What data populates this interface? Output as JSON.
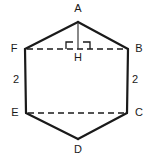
{
  "figure": {
    "kind": "hexagon-geometry-diagram",
    "background_color": "#ffffff",
    "stroke_color": "#1a1a1a",
    "label_color": "#1a1a1a",
    "canvas": {
      "width": 151,
      "height": 161
    }
  },
  "vertices": [
    {
      "id": "A",
      "label": "A",
      "x": 78,
      "y": 22,
      "label_x": 78,
      "label_y": 8
    },
    {
      "id": "B",
      "label": "B",
      "x": 128,
      "y": 49,
      "label_x": 139,
      "label_y": 44
    },
    {
      "id": "C",
      "label": "C",
      "x": 127,
      "y": 113,
      "label_x": 139,
      "label_y": 109
    },
    {
      "id": "D",
      "label": "D",
      "x": 78,
      "y": 139,
      "label_x": 78,
      "label_y": 149
    },
    {
      "id": "E",
      "label": "E",
      "x": 26,
      "y": 113,
      "label_x": 15,
      "label_y": 109
    },
    {
      "id": "F",
      "label": "F",
      "x": 25,
      "y": 49,
      "label_x": 14,
      "label_y": 44
    },
    {
      "id": "H",
      "label": "H",
      "x": 78,
      "y": 49,
      "label_x": 78,
      "label_y": 54
    }
  ],
  "solid_edges": [
    {
      "name": "edge-A-B",
      "from": "A",
      "to": "B"
    },
    {
      "name": "edge-B-C",
      "from": "B",
      "to": "C"
    },
    {
      "name": "edge-C-D",
      "from": "C",
      "to": "D"
    },
    {
      "name": "edge-D-E",
      "from": "D",
      "to": "E"
    },
    {
      "name": "edge-E-F",
      "from": "E",
      "to": "F"
    },
    {
      "name": "edge-F-A",
      "from": "F",
      "to": "A"
    }
  ],
  "dashed_segments": [
    {
      "name": "segment-F-B",
      "from": "F",
      "to": "B"
    },
    {
      "name": "segment-E-C",
      "from": "E",
      "to": "C"
    },
    {
      "name": "segment-A-H",
      "from": "A",
      "to": "H"
    }
  ],
  "side_labels": [
    {
      "name": "length-label-FE",
      "text": "2",
      "x": 16,
      "y": 80
    },
    {
      "name": "length-label-BC",
      "text": "2",
      "x": 135,
      "y": 80
    }
  ],
  "right_angle_marks": [
    {
      "name": "right-angle-mark-left",
      "x": 66,
      "y": 41,
      "size": 7
    },
    {
      "name": "right-angle-mark-right",
      "x": 83,
      "y": 41,
      "size": 7
    }
  ],
  "stroke_widths": {
    "solid_edge": 2.2,
    "dashed_edge": 1.6,
    "altitude": 1.2,
    "right_angle": 1.2
  },
  "dash_pattern": "6,4"
}
